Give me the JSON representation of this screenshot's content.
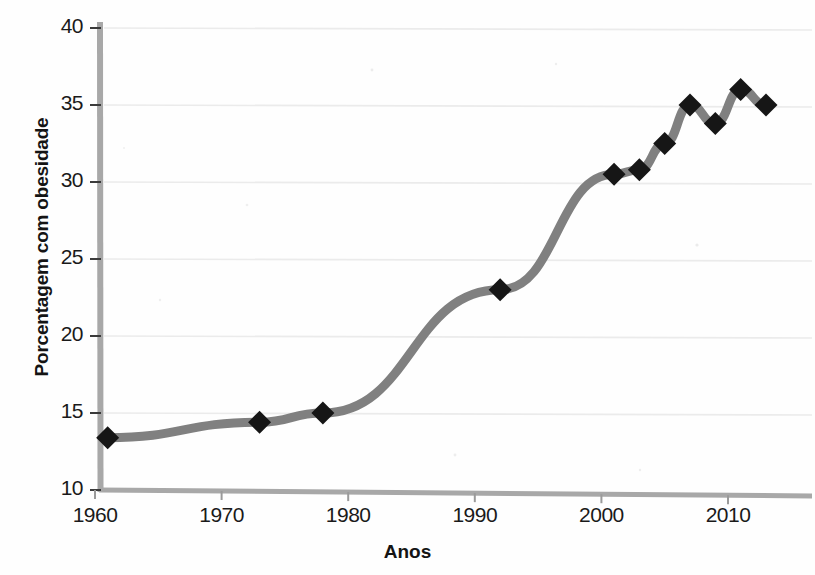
{
  "chart_data": {
    "type": "line",
    "title": "",
    "xlabel": "Anos",
    "ylabel": "Porcentagem com obesidade",
    "xlim": [
      1959,
      2015
    ],
    "ylim": [
      10,
      40
    ],
    "grid": true,
    "legend": "none",
    "series": [
      {
        "name": "Porcentagem com obesidade",
        "marker": "diamond",
        "line_color": "#808080",
        "marker_color": "#161616",
        "x": [
          1961,
          1973,
          1978,
          1992,
          2001,
          2003,
          2005,
          2007,
          2009,
          2011,
          2013
        ],
        "values": [
          13.4,
          14.4,
          15.0,
          23.0,
          30.5,
          30.8,
          32.5,
          35.0,
          33.8,
          36.0,
          35.0
        ]
      }
    ],
    "xticks": [
      1960,
      1970,
      1980,
      1990,
      2000,
      2010
    ],
    "xtick_labels": [
      "1960",
      "1970",
      "1980",
      "1990",
      "2000",
      "2010"
    ],
    "yticks": [
      10,
      15,
      20,
      25,
      30,
      35,
      40
    ],
    "ytick_labels": [
      "10",
      "15",
      "20",
      "25",
      "30",
      "35",
      "40"
    ],
    "colors": {
      "line": "#808080",
      "marker": "#161616",
      "axis": "#a8a8a8",
      "grid": "#ebebeb",
      "text": "#141414",
      "background": "#fefefe"
    }
  }
}
